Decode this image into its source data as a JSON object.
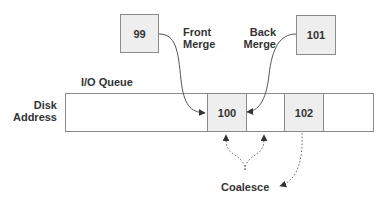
{
  "diagram": {
    "queue_label": "I/O Queue",
    "axis_label_line1": "Disk",
    "axis_label_line2": "Address",
    "incoming_requests": [
      {
        "id": "99",
        "label": "99"
      },
      {
        "id": "101",
        "label": "101"
      }
    ],
    "queue_cells": [
      {
        "label": "",
        "filled": false
      },
      {
        "label": "100",
        "filled": true
      },
      {
        "label": "",
        "filled": false
      },
      {
        "label": "102",
        "filled": true
      },
      {
        "label": "",
        "filled": false
      }
    ],
    "front_merge_line1": "Front",
    "front_merge_line2": "Merge",
    "back_merge_line1": "Back",
    "back_merge_line2": "Merge",
    "coalesce_label": "Coalesce",
    "colors": {
      "box_fill": "#eeeeee",
      "border": "#8a8a8a",
      "text": "#333333",
      "arrow": "#333333"
    }
  }
}
